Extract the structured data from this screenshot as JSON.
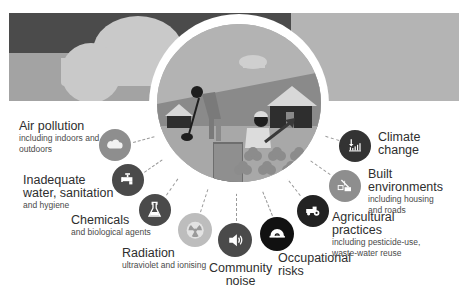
{
  "colors": {
    "banner_dark": "#4b4b4b",
    "banner_light": "#a3a3a3",
    "banner_right": "#b4b4b4",
    "icon_dark": "#4a4a4a",
    "icon_mid": "#8e8e8e",
    "icon_light": "#bdbdbd",
    "icon_black": "#111111"
  },
  "factors": [
    {
      "id": "air-pollution",
      "title": "Air pollution",
      "subtitle": "including indoors and outdoors",
      "icon": "cloud-icon"
    },
    {
      "id": "water",
      "title": "Inadequate water, sanitation",
      "subtitle": "and hygiene",
      "icon": "faucet-icon"
    },
    {
      "id": "chemicals",
      "title": "Chemicals",
      "subtitle": "and biological agents",
      "icon": "flask-icon"
    },
    {
      "id": "radiation",
      "title": "Radiation",
      "subtitle": "ultraviolet and ionising",
      "icon": "radiation-icon"
    },
    {
      "id": "noise",
      "title": "Community noise",
      "subtitle": "",
      "icon": "speaker-icon"
    },
    {
      "id": "occupational",
      "title": "Occupational risks",
      "subtitle": "",
      "icon": "hard-hat-icon"
    },
    {
      "id": "agricultural",
      "title": "Agricultural practices",
      "subtitle": "including pesticide-use, waste-water reuse",
      "icon": "tractor-icon"
    },
    {
      "id": "built",
      "title": "Built environments",
      "subtitle": "including housing and roads",
      "icon": "crane-icon"
    },
    {
      "id": "climate",
      "title": "Climate change",
      "subtitle": "",
      "icon": "thermometer-chart-icon"
    }
  ],
  "labels": {
    "air_t": "Air pollution",
    "air_s1": "including indoors and",
    "air_s2": "outdoors",
    "water_t1": "Inadequate",
    "water_t2": "water, sanitation",
    "water_s": "and hygiene",
    "chem_t": "Chemicals",
    "chem_s": "and biological agents",
    "rad_t": "Radiation",
    "rad_s": "ultraviolet and ionising",
    "noise_t1": "Community",
    "noise_t2": "noise",
    "occ_t1": "Occupational",
    "occ_t2": "risks",
    "agri_t1": "Agricultural",
    "agri_t2": "practices",
    "agri_s1": "including pesticide-use,",
    "agri_s2": "waste-water reuse",
    "built_t1": "Built",
    "built_t2": "environments",
    "built_s1": "including housing",
    "built_s2": "and roads",
    "climate_t1": "Climate",
    "climate_t2": "change"
  }
}
